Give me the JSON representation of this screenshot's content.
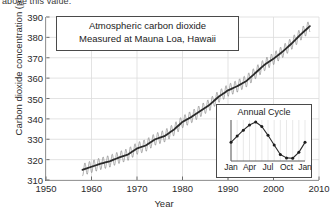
{
  "page": {
    "clipped_top_text": "above this value.",
    "clipped_bottom_text": ""
  },
  "chart_data": {
    "type": "line",
    "title": "Atmospheric carbon dioxide",
    "subtitle": "Measured at Mauna Loa, Hawaii",
    "xlabel": "Year",
    "ylabel": "Carbon dioxide concentration (ppmv)",
    "xlim": [
      1950,
      2010
    ],
    "ylim": [
      310,
      390
    ],
    "xticks": [
      1950,
      1960,
      1970,
      1980,
      1990,
      2000,
      2010
    ],
    "yticks": [
      310,
      320,
      330,
      340,
      350,
      360,
      370,
      380,
      390
    ],
    "grid": true,
    "legend": "none",
    "series": [
      {
        "name": "Monthly mean CO2 (with seasonal cycle)",
        "color": "#8a8a8a",
        "style": "thin-sawtooth",
        "seasonal_amplitude_ppm": 3.0
      },
      {
        "name": "Smoothed annual trend",
        "color": "#2a2a2a",
        "style": "thick-line",
        "x": [
          1958,
          1960,
          1962,
          1964,
          1966,
          1968,
          1970,
          1972,
          1974,
          1976,
          1978,
          1980,
          1982,
          1984,
          1986,
          1988,
          1990,
          1992,
          1994,
          1996,
          1998,
          2000,
          2002,
          2004,
          2006,
          2008
        ],
        "values": [
          315.0,
          316.5,
          318.0,
          319.2,
          321.0,
          322.5,
          325.5,
          327.0,
          330.0,
          331.5,
          334.5,
          338.5,
          341.0,
          344.0,
          347.0,
          351.0,
          354.0,
          356.0,
          358.5,
          362.5,
          366.5,
          369.5,
          373.0,
          377.0,
          381.5,
          385.5
        ]
      }
    ]
  },
  "inset_chart": {
    "type": "line",
    "title": "Annual Cycle",
    "xticks": [
      "Jan",
      "Apr",
      "Jul",
      "Oct",
      "Jan"
    ],
    "categories": [
      "Jan",
      "Feb",
      "Mar",
      "Apr",
      "May",
      "Jun",
      "Jul",
      "Aug",
      "Sep",
      "Oct",
      "Nov",
      "Dec",
      "Jan"
    ],
    "values": [
      0.45,
      0.62,
      0.78,
      0.92,
      1.0,
      0.88,
      0.64,
      0.38,
      0.12,
      0.03,
      0.02,
      0.18,
      0.45
    ],
    "marker": "filled-circle",
    "grid": true
  }
}
